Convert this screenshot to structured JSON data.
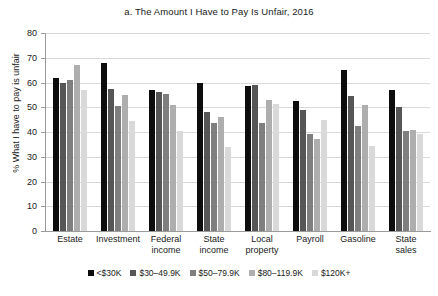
{
  "chart_data": {
    "type": "bar",
    "title": "a. The Amount I Have to Pay Is Unfair, 2016",
    "xlabel": "",
    "ylabel": "% What I have to pay is unfair",
    "ylim": [
      0,
      80
    ],
    "ytick_step": 10,
    "yticks": [
      0,
      10,
      20,
      30,
      40,
      50,
      60,
      70,
      80
    ],
    "grid": true,
    "legend_position": "bottom",
    "categories": [
      "Estate",
      "Investment",
      "Federal income",
      "State income",
      "Local property",
      "Payroll",
      "Gasoline",
      "State sales"
    ],
    "category_lines": [
      [
        "Estate"
      ],
      [
        "Investment"
      ],
      [
        "Federal",
        "income"
      ],
      [
        "State",
        "income"
      ],
      [
        "Local",
        "property"
      ],
      [
        "Payroll"
      ],
      [
        "Gasoline"
      ],
      [
        "State",
        "sales"
      ]
    ],
    "series": [
      {
        "name": "<$30K",
        "color": "#0d0d0d",
        "values": [
          62,
          68,
          57,
          60,
          58.5,
          52.5,
          65,
          57
        ]
      },
      {
        "name": "$30–49.9K",
        "color": "#565656",
        "values": [
          60,
          57.5,
          56,
          48,
          59,
          49,
          54.5,
          50
        ]
      },
      {
        "name": "$50–79.9K",
        "color": "#7f7f7f",
        "values": [
          61,
          50.5,
          55.5,
          43.5,
          43.5,
          39,
          42.5,
          40.5
        ]
      },
      {
        "name": "$80–119.9K",
        "color": "#aeaeae",
        "values": [
          67,
          55,
          51,
          46,
          53,
          37,
          51,
          41
        ]
      },
      {
        "name": "$120K+",
        "color": "#d9d9d9",
        "values": [
          57,
          44.5,
          40.5,
          34,
          51.5,
          45,
          34.5,
          39
        ]
      }
    ]
  }
}
